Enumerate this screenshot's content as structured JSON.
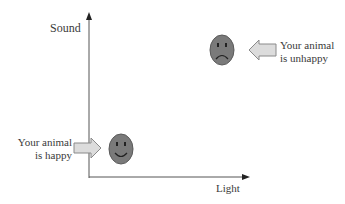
{
  "diagram": {
    "y_axis_label": "Sound",
    "x_axis_label": "Light",
    "unhappy": {
      "line1": "Your animal",
      "line2": "is unhappy",
      "face": "sad-face-icon"
    },
    "happy": {
      "line1": "Your animal",
      "line2": "is happy",
      "face": "happy-face-icon"
    },
    "colors": {
      "axis": "#555555",
      "face_fill": "#7a7a7a",
      "face_stroke": "#5a5a5a",
      "arrow_fill": "#dcdcdc",
      "arrow_stroke": "#8a8a8a"
    }
  }
}
